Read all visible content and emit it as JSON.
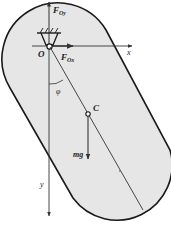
{
  "diagram": {
    "type": "physical-pendulum-free-body",
    "colors": {
      "body_fill": "#e6e6e6",
      "outline": "#1a1a1a",
      "axis": "#333333",
      "text": "#222222"
    },
    "labels": {
      "force_oy": "F",
      "force_oy_sub": "Oy",
      "force_ox": "F",
      "force_ox_sub": "Ox",
      "pivot": "O",
      "x_axis": "x",
      "y_axis": "y",
      "angle": "φ",
      "center": "C",
      "weight": "mg"
    }
  }
}
